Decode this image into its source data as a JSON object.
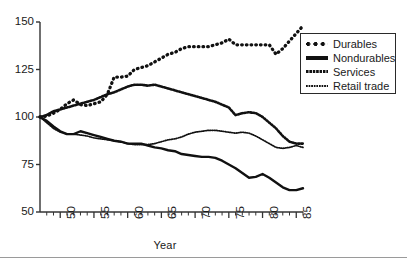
{
  "chart_data": {
    "type": "line",
    "title": "",
    "xlabel": "Year",
    "ylabel": "",
    "xlim": [
      1947,
      1986
    ],
    "ylim": [
      50,
      150
    ],
    "grid": false,
    "legend_position": "top-right",
    "yticks": [
      50,
      75,
      100,
      125,
      150
    ],
    "ytick_labels": [
      "50",
      "75",
      "100",
      "125",
      "150"
    ],
    "xticks": [
      1950,
      1955,
      1960,
      1965,
      1970,
      1975,
      1980,
      1985
    ],
    "xtick_labels": [
      "50",
      "55",
      "60",
      "65",
      "70",
      "75",
      "80",
      "85"
    ],
    "x": [
      1947,
      1948,
      1949,
      1950,
      1951,
      1952,
      1953,
      1954,
      1955,
      1956,
      1957,
      1958,
      1959,
      1960,
      1961,
      1962,
      1963,
      1964,
      1965,
      1966,
      1967,
      1968,
      1969,
      1970,
      1971,
      1972,
      1973,
      1974,
      1975,
      1976,
      1977,
      1978,
      1979,
      1980,
      1981,
      1982,
      1983,
      1984,
      1985,
      1986
    ],
    "series": [
      {
        "name": "Durables",
        "style": "dotted-large",
        "color": "#111111",
        "values": [
          100,
          100.5,
          102,
          104,
          107,
          109,
          106.5,
          106,
          107,
          108,
          112,
          121,
          121,
          121.5,
          125,
          126,
          127,
          129,
          131,
          133,
          134,
          136,
          137,
          137,
          137,
          137,
          138,
          139,
          141,
          138,
          138,
          138,
          138,
          138,
          138,
          133,
          136,
          140,
          144,
          148
        ]
      },
      {
        "name": "Nondurables",
        "style": "solid",
        "color": "#111111",
        "values": [
          100,
          98,
          95,
          92.5,
          91,
          91,
          92.5,
          91.5,
          90.5,
          89.5,
          88.5,
          87.5,
          87,
          86,
          86,
          86,
          85,
          84,
          83.5,
          82.5,
          82,
          80.5,
          80,
          79.5,
          79,
          79,
          78.5,
          77,
          75,
          73,
          70.5,
          68,
          68.5,
          70,
          68,
          65.5,
          63,
          61.5,
          61.5,
          62.5
        ]
      },
      {
        "name": "Services",
        "style": "dotted-medium",
        "color": "#111111",
        "values": [
          100,
          101,
          103,
          104,
          105,
          106,
          107,
          108,
          109,
          110.5,
          112,
          113,
          114.5,
          116,
          117,
          117,
          116.5,
          117,
          116,
          115,
          114,
          113,
          112,
          111,
          110,
          109,
          108,
          106.5,
          105,
          101,
          102,
          102.5,
          102,
          100,
          97,
          94,
          90,
          87,
          86,
          86
        ]
      },
      {
        "name": "Retail trade",
        "style": "dotted-fine",
        "color": "#111111",
        "values": [
          100,
          97,
          94,
          92,
          91,
          91,
          90.5,
          90,
          89,
          88.5,
          88,
          87.5,
          87,
          86,
          85.5,
          85.5,
          85.5,
          86,
          87,
          88,
          88.5,
          89.5,
          91,
          92,
          92.5,
          93,
          93,
          92.5,
          92,
          91.5,
          92,
          91.5,
          90,
          88,
          86,
          84,
          83.5,
          84,
          85,
          84
        ]
      }
    ]
  }
}
